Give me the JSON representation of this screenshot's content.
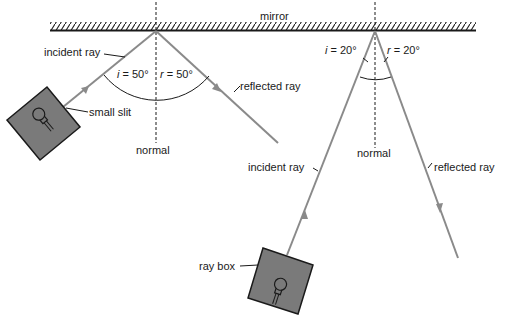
{
  "labels": {
    "mirror": "mirror",
    "left_incident": "incident ray",
    "left_slit": "small slit",
    "left_reflected": "reflected ray",
    "left_normal": "normal",
    "left_i": "i",
    "left_i_val": " = 50°",
    "left_r": "r",
    "left_r_val": " = 50°",
    "right_incident": "incident ray",
    "right_reflected": "reflected ray",
    "right_normal": "normal",
    "right_i": "i",
    "right_i_val": " = 20°",
    "right_r": "r",
    "right_r_val": " = 20°",
    "ray_box": "ray box"
  },
  "colors": {
    "ray": "#8a8a8a",
    "box_fill": "#7a7a7a",
    "ink": "#1a1a1a"
  },
  "diagram": {
    "left_experiment": {
      "angle_of_incidence_deg": 50,
      "angle_of_reflection_deg": 50
    },
    "right_experiment": {
      "angle_of_incidence_deg": 20,
      "angle_of_reflection_deg": 20
    }
  }
}
